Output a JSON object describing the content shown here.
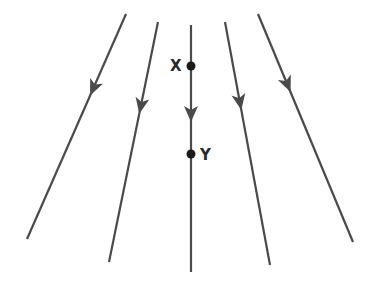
{
  "diagram": {
    "title": "",
    "line_color": "#4a4a4a",
    "point_color": "#1a1a1a",
    "field_lines": [
      {
        "id": "line-1",
        "x1": 126,
        "y1": 14,
        "x2": 27,
        "y2": 239,
        "arrow_at": 0.33,
        "direction": "down"
      },
      {
        "id": "line-2",
        "x1": 158,
        "y1": 22,
        "x2": 109,
        "y2": 262,
        "arrow_at": 0.35,
        "direction": "down"
      },
      {
        "id": "line-3",
        "x1": 191,
        "y1": 25,
        "x2": 191,
        "y2": 272,
        "arrow_at": 0.36,
        "direction": "down"
      },
      {
        "id": "line-4",
        "x1": 225,
        "y1": 22,
        "x2": 270,
        "y2": 265,
        "arrow_at": 0.33,
        "direction": "down"
      },
      {
        "id": "line-5",
        "x1": 258,
        "y1": 14,
        "x2": 353,
        "y2": 242,
        "arrow_at": 0.31,
        "direction": "down"
      }
    ],
    "points": [
      {
        "label": "X",
        "x": 191,
        "y": 66,
        "label_x": 170,
        "label_y": 66
      },
      {
        "label": "Y",
        "x": 191,
        "y": 154,
        "label_x": 200,
        "label_y": 155
      }
    ]
  }
}
